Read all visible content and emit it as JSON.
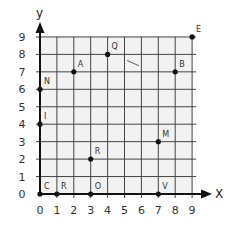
{
  "axes": {
    "x_label": "X",
    "y_label": "y",
    "x_ticks": [
      "0",
      "1",
      "2",
      "3",
      "4",
      "5",
      "6",
      "7",
      "8",
      "9"
    ],
    "y_ticks": [
      "0",
      "1",
      "2",
      "3",
      "4",
      "5",
      "6",
      "7",
      "8",
      "9"
    ],
    "x_range": [
      0,
      9
    ],
    "y_range": [
      0,
      9
    ]
  },
  "colors": {
    "grid_fill": "#f2f2f2",
    "grid_line": "#444444",
    "axis": "#111111",
    "point": "#111111"
  },
  "points": [
    {
      "label": "C",
      "x": 0,
      "y": 0
    },
    {
      "label": "R",
      "x": 1,
      "y": 0
    },
    {
      "label": "O",
      "x": 3,
      "y": 0
    },
    {
      "label": "V",
      "x": 7,
      "y": 0
    },
    {
      "label": "R",
      "x": 3,
      "y": 2
    },
    {
      "label": "M",
      "x": 7,
      "y": 3
    },
    {
      "label": "I",
      "x": 0,
      "y": 4
    },
    {
      "label": "N",
      "x": 0,
      "y": 6
    },
    {
      "label": "A",
      "x": 2,
      "y": 7
    },
    {
      "label": "B",
      "x": 8,
      "y": 7
    },
    {
      "label": "Q",
      "x": 4,
      "y": 8
    },
    {
      "label": "E",
      "x": 9,
      "y": 9
    }
  ],
  "annotation_stroke": {
    "from": [
      5.15,
      7.65
    ],
    "to": [
      5.85,
      7.35
    ]
  }
}
